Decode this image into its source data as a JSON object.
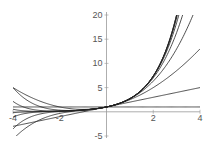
{
  "chart_data": {
    "type": "line",
    "title": "",
    "xlabel": "",
    "ylabel": "",
    "xlim": [
      -4,
      4
    ],
    "ylim": [
      -5,
      20
    ],
    "xticks": [
      -4,
      -2,
      2,
      4
    ],
    "yticks": [
      -5,
      5,
      10,
      15,
      20
    ],
    "grid": false,
    "legend": null,
    "series": [
      {
        "name": "order 0",
        "order": 0
      },
      {
        "name": "order 1",
        "order": 1
      },
      {
        "name": "order 2",
        "order": 2
      },
      {
        "name": "order 3",
        "order": 3
      },
      {
        "name": "order 4",
        "order": 4
      },
      {
        "name": "order 5",
        "order": 5
      },
      {
        "name": "order 6",
        "order": 6
      },
      {
        "name": "order 7",
        "order": 7
      },
      {
        "name": "order 8",
        "order": 8
      },
      {
        "name": "order 9",
        "order": 9
      }
    ]
  }
}
